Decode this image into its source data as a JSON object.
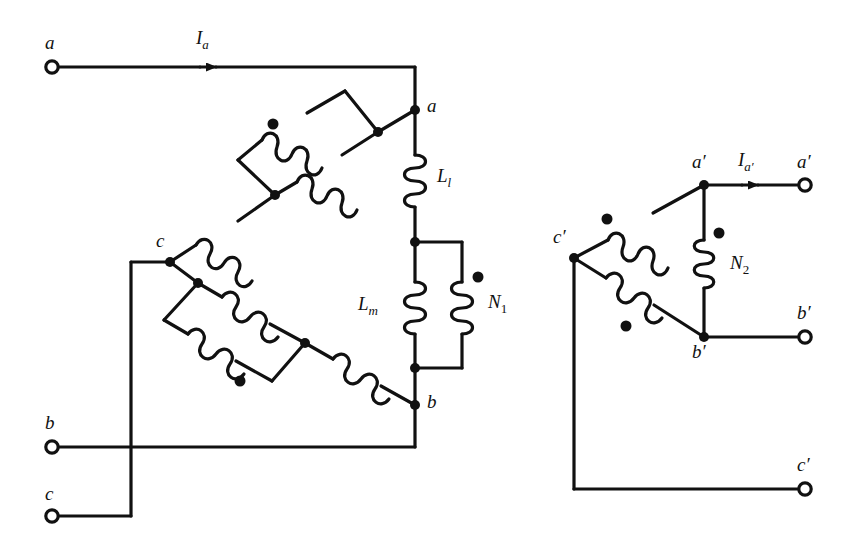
{
  "figure": {
    "type": "circuit-schematic",
    "line_color": "#111111",
    "background_color": "#ffffff"
  },
  "primary_side": {
    "terminals": [
      {
        "id": "term-a",
        "label": "a",
        "x": 52,
        "y": 67
      },
      {
        "id": "term-b",
        "label": "b",
        "x": 52,
        "y": 447
      },
      {
        "id": "term-c",
        "label": "c",
        "x": 52,
        "y": 516
      }
    ],
    "nodes": [
      {
        "id": "node-a",
        "label": "a",
        "x": 415,
        "y": 110
      },
      {
        "id": "node-b",
        "label": "b",
        "x": 415,
        "y": 405
      },
      {
        "id": "node-c",
        "label": "c",
        "x": 170,
        "y": 262
      }
    ],
    "current_label": "I",
    "current_sub": "a",
    "elements": [
      {
        "id": "leakage-inductor",
        "label": "L",
        "sub": "l"
      },
      {
        "id": "magnetizing-inductor",
        "label": "L",
        "sub": "m"
      },
      {
        "id": "primary-winding",
        "label": "N",
        "sub": "1"
      }
    ]
  },
  "secondary_side": {
    "terminals": [
      {
        "id": "term-a-prime",
        "label": "a′",
        "x": 805,
        "y": 185
      },
      {
        "id": "term-b-prime",
        "label": "b′",
        "x": 805,
        "y": 337
      },
      {
        "id": "term-c-prime",
        "label": "c′",
        "x": 805,
        "y": 489
      }
    ],
    "nodes": [
      {
        "id": "node-a-prime",
        "label": "a′",
        "x": 704,
        "y": 185
      },
      {
        "id": "node-b-prime",
        "label": "b′",
        "x": 704,
        "y": 337
      },
      {
        "id": "node-c-prime",
        "label": "c′",
        "x": 574,
        "y": 258
      }
    ],
    "current_label": "I",
    "current_sub": "a′",
    "elements": [
      {
        "id": "secondary-winding",
        "label": "N",
        "sub": "2"
      }
    ]
  },
  "labels": {
    "term_a": "a",
    "term_b": "b",
    "term_c": "c",
    "node_a": "a",
    "node_b": "b",
    "node_c": "c",
    "current_ia_main": "I",
    "current_ia_sub": "a",
    "leak_main": "L",
    "leak_sub": "l",
    "mag_main": "L",
    "mag_sub": "m",
    "n1_main": "N",
    "n1_sub": "1",
    "node_a_prime": "a′",
    "node_b_prime": "b′",
    "node_c_prime": "c′",
    "term_a_prime": "a′",
    "term_b_prime": "b′",
    "term_c_prime": "c′",
    "current_iap_main": "I",
    "current_iap_sub": "a′",
    "n2_main": "N",
    "n2_sub": "2"
  }
}
